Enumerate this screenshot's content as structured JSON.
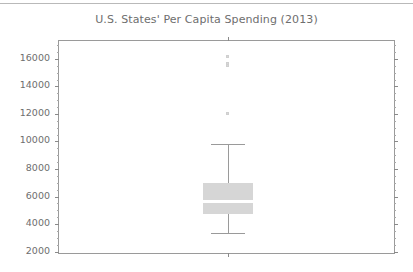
{
  "figure": {
    "title": "U.S. States' Per Capita Spending (2013)"
  },
  "axes": {
    "y_tick_labels": [
      "16000",
      "14000",
      "12000",
      "10000",
      "8000",
      "6000",
      "4000",
      "2000"
    ],
    "x_tick_labels": [
      ""
    ]
  },
  "chart_data": {
    "type": "box",
    "title": "U.S. States' Per Capita Spending (2013)",
    "subtitle": "",
    "xlabel": "",
    "ylabel": "",
    "ylim": [
      1750,
      17300
    ],
    "xlim": [
      0,
      2
    ],
    "grid": false,
    "legend": null,
    "y_ticks": [
      2000,
      4000,
      6000,
      8000,
      10000,
      12000,
      14000,
      16000
    ],
    "y_minor_tick_step": 500,
    "categories": [
      ""
    ],
    "boxes": [
      {
        "label": "",
        "x_position": 1,
        "whisker_low": 3350,
        "q1": 4750,
        "median": 5650,
        "q3": 7000,
        "whisker_high": 9800,
        "outliers": [
          16150,
          15700,
          15500,
          12000
        ],
        "box_fill": "#d6d6d6",
        "median_color": "#ffffff",
        "whisker_color": "#9a9a9a",
        "flier_color": "#d8d8d8"
      }
    ]
  },
  "style": {
    "background": "#ffffff",
    "axis_color": "#9a9a9a",
    "tick_color": "#8a8a8a",
    "text_color": "#6e6e6e"
  }
}
